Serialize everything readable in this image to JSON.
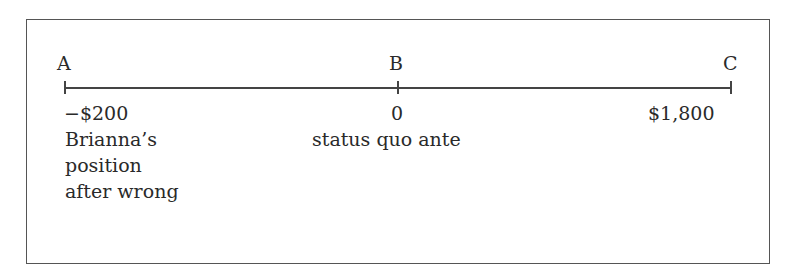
{
  "points": [
    {
      "letter": "A",
      "value": "−$200",
      "desc": [
        "Brianna’s",
        "position",
        "after wrong"
      ]
    },
    {
      "letter": "B",
      "value": "0",
      "desc": [
        "status quo ante"
      ]
    },
    {
      "letter": "C",
      "value": "$1,800",
      "desc": []
    }
  ]
}
